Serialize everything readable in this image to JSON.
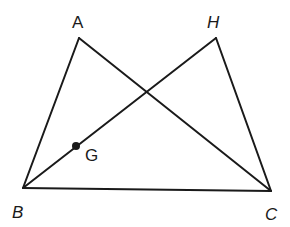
{
  "diagram": {
    "type": "geometry-figure",
    "stroke_color": "#1a1a1a",
    "background": "#ffffff",
    "points": {
      "A": {
        "label": "A",
        "x": 79,
        "y": 38
      },
      "H": {
        "label": "H",
        "x": 216,
        "y": 38
      },
      "B": {
        "label": "B",
        "x": 23,
        "y": 188
      },
      "C": {
        "label": "C",
        "x": 271,
        "y": 191
      },
      "G": {
        "label": "G",
        "x": 76,
        "y": 146
      }
    },
    "segments": [
      {
        "from": "A",
        "to": "B"
      },
      {
        "from": "A",
        "to": "C"
      },
      {
        "from": "B",
        "to": "C"
      },
      {
        "from": "B",
        "to": "H"
      },
      {
        "from": "H",
        "to": "C"
      }
    ],
    "marked_points": [
      "G"
    ],
    "labels": {
      "A": "A",
      "H": "H",
      "B": "B",
      "C": "C",
      "G": "G"
    }
  }
}
